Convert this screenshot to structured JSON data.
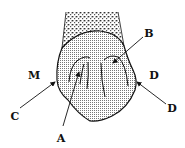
{
  "diagram": {
    "type": "labeled-anatomical-sketch",
    "colors": {
      "stroke": "#111111",
      "crown_fill": "#d9d9d9",
      "root_fill": "#bdbdbd",
      "background": "#ffffff"
    },
    "side_labels": {
      "left": "M",
      "right": "D"
    },
    "callouts": [
      {
        "id": "A",
        "label": "A",
        "text_x": 61,
        "text_y": 138,
        "from": [
          63,
          126
        ],
        "to": [
          79,
          72
        ]
      },
      {
        "id": "B",
        "label": "B",
        "text_x": 149,
        "text_y": 33,
        "from": [
          143,
          37
        ],
        "to": [
          113,
          63
        ]
      },
      {
        "id": "C",
        "label": "C",
        "text_x": 15,
        "text_y": 116,
        "from": [
          20,
          108
        ],
        "to": [
          55,
          82
        ]
      },
      {
        "id": "D",
        "label": "D",
        "text_x": 172,
        "text_y": 108,
        "from": [
          166,
          104
        ],
        "to": [
          137,
          82
        ]
      }
    ]
  }
}
